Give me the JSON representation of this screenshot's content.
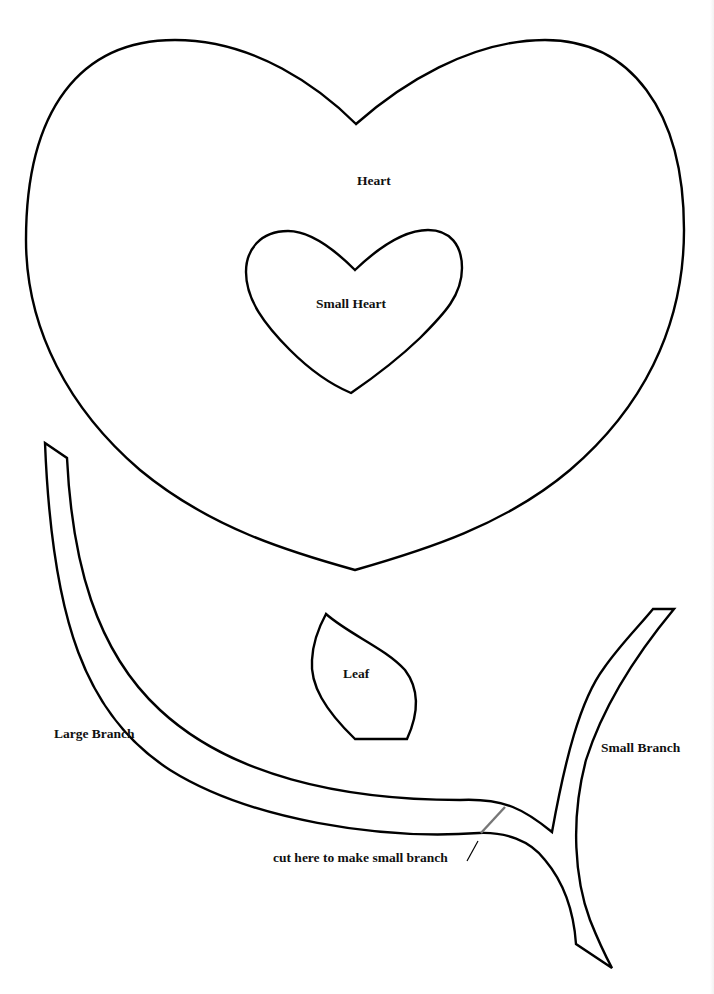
{
  "page": {
    "type": "printable craft template",
    "background_color": "#ffffff",
    "outline_color": "#000000",
    "cut_guide_color": "#777777"
  },
  "shapes": [
    {
      "id": "heart",
      "label": "Heart"
    },
    {
      "id": "small-heart",
      "label": "Small Heart"
    },
    {
      "id": "leaf",
      "label": "Leaf"
    },
    {
      "id": "large-branch",
      "label": "Large Branch"
    },
    {
      "id": "small-branch",
      "label": "Small Branch"
    }
  ],
  "labels": {
    "heart": "Heart",
    "small_heart": "Small Heart",
    "leaf": "Leaf",
    "large_branch": "Large Branch",
    "small_branch": "Small Branch",
    "cut_instruction": "cut here to make small branch"
  }
}
